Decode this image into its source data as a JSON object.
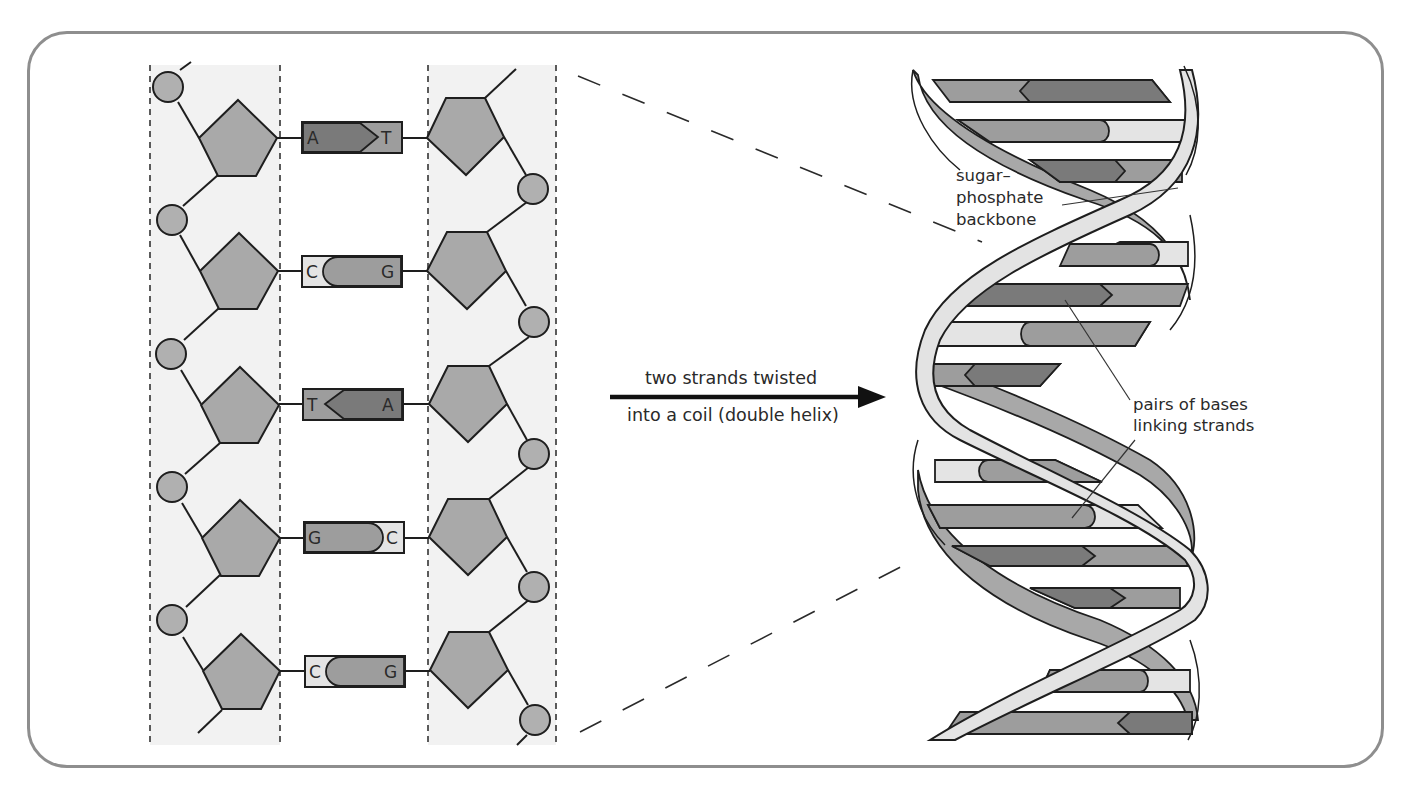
{
  "figure": {
    "colors": {
      "frame": "#8e8e8e",
      "strip_bg": "#f2f2f2",
      "sugar_fill": "#a9a9a9",
      "phosphate_fill": "#b0b0b0",
      "base_dark": "#7a7a7a",
      "base_mid": "#9d9d9d",
      "base_light": "#e4e4e4",
      "backbone_light": "#e3e3e3",
      "backbone_dark": "#a8a8a8",
      "outline": "#1e1e1e"
    }
  },
  "ladder": {
    "base_pairs": [
      {
        "left": "A",
        "right": "T",
        "left_shape": "arrow-right",
        "left_tone": "dark",
        "right_tone": "mid"
      },
      {
        "left": "C",
        "right": "G",
        "left_shape": "cup",
        "left_tone": "light",
        "right_tone": "mid"
      },
      {
        "left": "T",
        "right": "A",
        "left_shape": "arrow-left",
        "left_tone": "mid",
        "right_tone": "dark"
      },
      {
        "left": "G",
        "right": "C",
        "left_shape": "round-right",
        "left_tone": "mid",
        "right_tone": "light"
      },
      {
        "left": "C",
        "right": "G",
        "left_shape": "cup",
        "left_tone": "light",
        "right_tone": "mid"
      }
    ]
  },
  "arrow": {
    "line1": "two strands twisted",
    "line2": "into a coil (double helix)"
  },
  "labels": {
    "backbone_line1": "sugar–",
    "backbone_line2": "phosphate",
    "backbone_line3": "backbone",
    "pairs_line1": "pairs of bases",
    "pairs_line2": "linking strands"
  }
}
